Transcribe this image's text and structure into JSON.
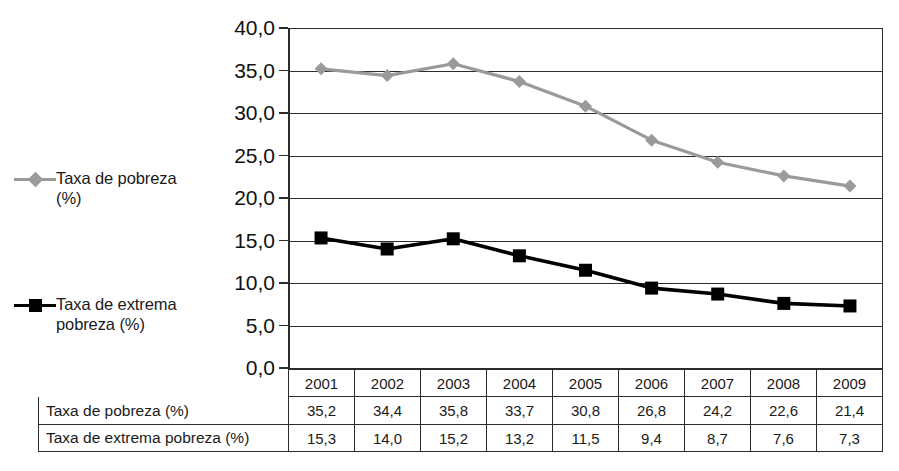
{
  "legend": {
    "entries": [
      {
        "label": "Taxa de pobreza\n(%)",
        "marker": "diamond-marker-icon",
        "color": "#9a9a9a"
      },
      {
        "label": "Taxa de extrema\npobreza (%)",
        "marker": "square-marker-icon",
        "color": "#000000"
      }
    ]
  },
  "axis": {
    "y_ticks": [
      "40,0",
      "35,0",
      "30,0",
      "25,0",
      "20,0",
      "15,0",
      "10,0",
      "5,0",
      "0,0"
    ]
  },
  "table": {
    "years": [
      "2001",
      "2002",
      "2003",
      "2004",
      "2005",
      "2006",
      "2007",
      "2008",
      "2009"
    ],
    "rows": [
      {
        "label": "Taxa de pobreza (%)",
        "values": [
          "35,2",
          "34,4",
          "35,8",
          "33,7",
          "30,8",
          "26,8",
          "24,2",
          "22,6",
          "21,4"
        ]
      },
      {
        "label": "Taxa de extrema pobreza (%)",
        "values": [
          "15,3",
          "14,0",
          "15,2",
          "13,2",
          "11,5",
          "9,4",
          "8,7",
          "7,6",
          "7,3"
        ]
      }
    ]
  },
  "chart_data": {
    "type": "line",
    "title": "",
    "xlabel": "",
    "ylabel": "",
    "categories": [
      "2001",
      "2002",
      "2003",
      "2004",
      "2005",
      "2006",
      "2007",
      "2008",
      "2009"
    ],
    "series": [
      {
        "name": "Taxa de pobreza (%)",
        "color": "#9a9a9a",
        "marker": "diamond",
        "values": [
          35.2,
          34.4,
          35.8,
          33.7,
          30.8,
          26.8,
          24.2,
          22.6,
          21.4
        ]
      },
      {
        "name": "Taxa de extrema pobreza (%)",
        "color": "#000000",
        "marker": "square",
        "values": [
          15.3,
          14.0,
          15.2,
          13.2,
          11.5,
          9.4,
          8.7,
          7.6,
          7.3
        ]
      }
    ],
    "ylim": [
      0,
      40
    ],
    "ytick_step": 5,
    "grid": true,
    "legend_position": "left"
  }
}
